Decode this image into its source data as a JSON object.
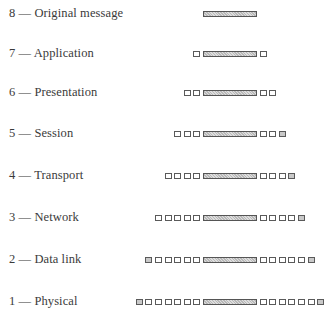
{
  "diagram": {
    "message_bar": {
      "left_px": 203,
      "width_px": 54
    },
    "box_pitch_px": 9.6,
    "layers": [
      {
        "number": "8",
        "label": "8 — Original message",
        "name": "Original message",
        "headers": 0,
        "trailers": 0,
        "top": 3
      },
      {
        "number": "7",
        "label": "7 — Application",
        "name": "Application",
        "headers": 1,
        "trailers": 1,
        "top": 43
      },
      {
        "number": "6",
        "label": "6 — Presentation",
        "name": "Presentation",
        "headers": 2,
        "trailers": 2,
        "top": 82
      },
      {
        "number": "5",
        "label": "5 — Session",
        "name": "Session",
        "headers": 3,
        "trailers": 3,
        "top": 123
      },
      {
        "number": "4",
        "label": "4 — Transport",
        "name": "Transport",
        "headers": 4,
        "trailers": 4,
        "top": 165
      },
      {
        "number": "3",
        "label": "3 — Network",
        "name": "Network",
        "headers": 5,
        "trailers": 5,
        "top": 207
      },
      {
        "number": "2",
        "label": "2 — Data link",
        "name": "Data link",
        "headers": 6,
        "trailers": 6,
        "top": 249
      },
      {
        "number": "1",
        "label": "1 — Physical",
        "name": "Physical",
        "headers": 7,
        "trailers": 7,
        "top": 291
      }
    ]
  }
}
